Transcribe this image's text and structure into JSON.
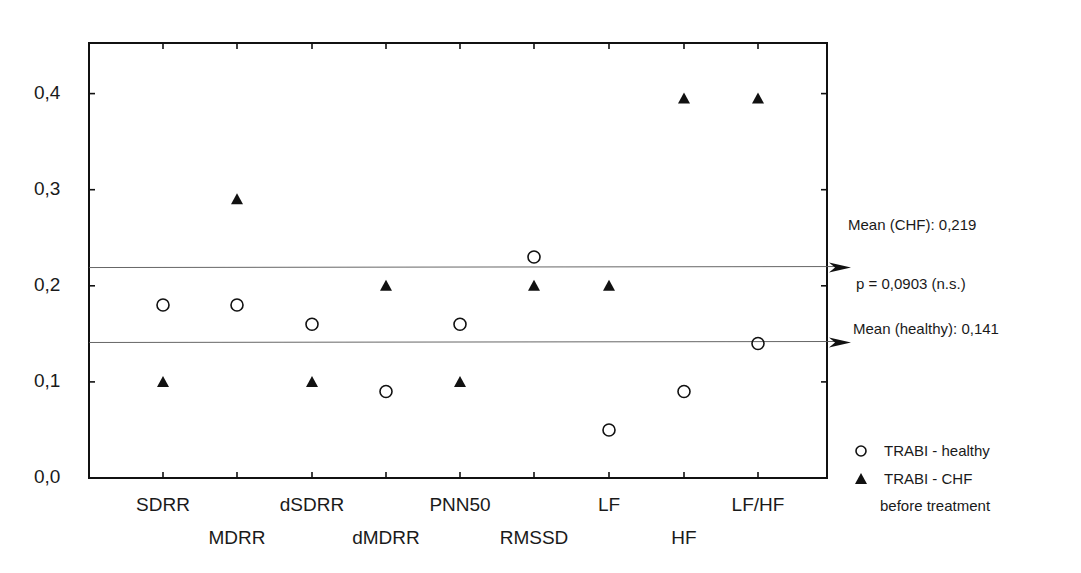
{
  "chart_data": {
    "type": "scatter",
    "title": "",
    "xlabel": "",
    "ylabel": "",
    "ylim": [
      0,
      0.45
    ],
    "yticks": [
      "0,0",
      "0,1",
      "0,2",
      "0,3",
      "0,4"
    ],
    "ytick_values": [
      0,
      0.1,
      0.2,
      0.3,
      0.4
    ],
    "categories": [
      "SDRR",
      "MDRR",
      "dSDRR",
      "dMDRR",
      "PNN50",
      "RMSSD",
      "LF",
      "HF",
      "LF/HF"
    ],
    "series": [
      {
        "name": "TRABI - healthy",
        "marker": "open-circle",
        "values": [
          0.18,
          0.18,
          0.16,
          0.09,
          0.16,
          0.23,
          0.05,
          0.09,
          0.14
        ]
      },
      {
        "name": "TRABI - CHF before treatment",
        "marker": "filled-triangle",
        "values": [
          0.1,
          0.29,
          0.1,
          0.2,
          0.1,
          0.2,
          0.2,
          0.395,
          0.395
        ]
      }
    ],
    "reference_lines": [
      {
        "label": "Mean (CHF): 0,219",
        "value": 0.219
      },
      {
        "label": "Mean (healthy): 0,141",
        "value": 0.141
      }
    ],
    "annotations": [
      "p = 0,0903 (n.s.)"
    ],
    "legend": {
      "position": "right-bottom",
      "entries": [
        "TRABI - healthy",
        "TRABI - CHF",
        "before treatment"
      ]
    },
    "grid": false
  },
  "labels": {
    "mean_chf": "Mean (CHF): 0,219",
    "p_value": "p = 0,0903 (n.s.)",
    "mean_healthy": "Mean (healthy): 0,141",
    "legend_healthy": "TRABI - healthy",
    "legend_chf_1": "TRABI - CHF",
    "legend_chf_2": "before treatment"
  }
}
